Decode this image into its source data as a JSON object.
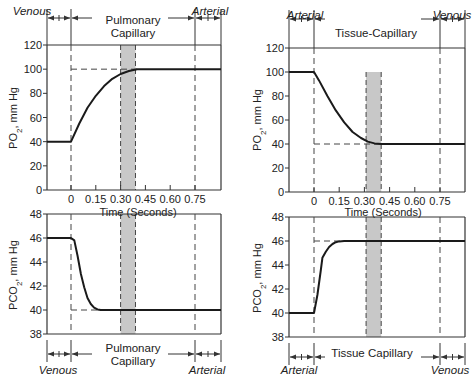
{
  "chart_data": [
    {
      "id": "left-top",
      "type": "line",
      "title": "Pulmonary Capillary",
      "ylabel": "PO2, mm Hg",
      "xlabel": "Time (Seconds)",
      "ylim": [
        0,
        120
      ],
      "yticks": [
        0,
        20,
        40,
        60,
        80,
        100,
        120
      ],
      "xticks": [
        "0",
        "0.15",
        "0.30",
        "0.45",
        "0.60",
        "0.75"
      ],
      "x": [
        -0.15,
        0,
        0.05,
        0.1,
        0.15,
        0.2,
        0.25,
        0.3,
        0.35,
        0.4,
        0.45,
        0.9
      ],
      "values": [
        40,
        40,
        55,
        68,
        78,
        86,
        92,
        96,
        98.5,
        100,
        100,
        100
      ],
      "reference_lines": {
        "y": 100,
        "shade_x": [
          0.3,
          0.39
        ]
      },
      "regions_top": {
        "left": "Venous",
        "center": "Pulmonary Capillary",
        "right": "Arterial"
      }
    },
    {
      "id": "left-bottom",
      "type": "line",
      "title": "Pulmonary Capillary",
      "ylabel": "PCO2, mm Hg",
      "ylim": [
        38,
        48
      ],
      "yticks": [
        38,
        40,
        42,
        44,
        46,
        48
      ],
      "x": [
        -0.15,
        0,
        0.02,
        0.04,
        0.06,
        0.08,
        0.1,
        0.12,
        0.14,
        0.16,
        0.18,
        0.9
      ],
      "values": [
        46,
        46,
        45.8,
        44.5,
        43,
        41.9,
        41,
        40.5,
        40.2,
        40.05,
        40,
        40
      ],
      "reference_lines": {
        "y": 40,
        "shade_x": [
          0.3,
          0.39
        ]
      },
      "regions_bottom": {
        "left": "Venous",
        "center": "Pulmonary Capillary",
        "right": "Arterial"
      }
    },
    {
      "id": "right-top",
      "type": "line",
      "title": "Tissue-Capillary",
      "ylabel": "PO2, mm Hg",
      "xlabel": "Time (Seconds)",
      "ylim": [
        0,
        120
      ],
      "yticks": [
        0,
        20,
        40,
        60,
        80,
        100,
        120
      ],
      "xticks": [
        "0",
        "0.15",
        "0.30",
        "0.45",
        "0.60",
        "0.75"
      ],
      "x": [
        -0.15,
        0,
        0.03,
        0.08,
        0.13,
        0.18,
        0.23,
        0.28,
        0.32,
        0.36,
        0.4,
        0.9
      ],
      "values": [
        100,
        100,
        93,
        80,
        68,
        58,
        50,
        45,
        42,
        40.5,
        40,
        40
      ],
      "reference_lines": {
        "y": 40,
        "shade_x": [
          0.31,
          0.4
        ]
      },
      "regions_top": {
        "left": "Arterial",
        "center": "Tissue-Capillary",
        "right": "Venous"
      }
    },
    {
      "id": "right-bottom",
      "type": "line",
      "title": "Tissue Capillary",
      "ylabel": "PCO2, mm Hg",
      "ylim": [
        38,
        48
      ],
      "yticks": [
        38,
        40,
        42,
        44,
        46,
        48
      ],
      "x": [
        -0.15,
        0,
        0.02,
        0.04,
        0.05,
        0.07,
        0.09,
        0.11,
        0.13,
        0.15,
        0.18,
        0.9
      ],
      "values": [
        40,
        40,
        41.5,
        43.5,
        44.6,
        45.1,
        45.5,
        45.75,
        45.9,
        45.97,
        46,
        46
      ],
      "reference_lines": {
        "y": 46,
        "shade_x": [
          0.31,
          0.4
        ]
      },
      "regions_bottom": {
        "left": "Arterial",
        "center": "Tissue Capillary",
        "right": "Venous"
      }
    }
  ],
  "labels": {
    "left_top_region_left": "Venous",
    "left_top_region_right": "Arterial",
    "left_top_center_1": "Pulmonary",
    "left_top_center_2": "Capillary",
    "left_bottom_region_left": "Venous",
    "left_bottom_region_right": "Arterial",
    "left_bottom_center_1": "Pulmonary",
    "left_bottom_center_2": "Capillary",
    "right_top_region_left": "Arterial",
    "right_top_region_right": "Venous",
    "right_top_center": "Tissue-Capillary",
    "right_bottom_region_left": "Arterial",
    "right_bottom_region_right": "Venous",
    "right_bottom_center": "Tissue Capillary",
    "xlabel": "Time (Seconds)",
    "po2": "PO",
    "pco2": "PCO",
    "sub2": "2",
    "units": ", mm Hg"
  },
  "colors": {
    "line": "#1a1a1a",
    "shade": "#c8c8c8",
    "axis": "#333333",
    "dash": "#444444"
  }
}
